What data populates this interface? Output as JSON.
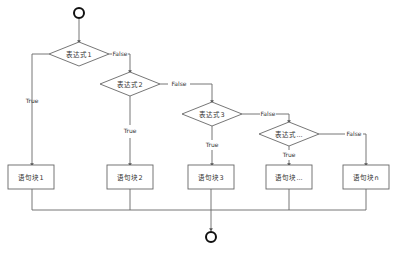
{
  "diagram": {
    "type": "flowchart",
    "colors": {
      "line": "#666666",
      "node_border": "#666666",
      "node_fill": "#ffffff",
      "terminal": "#111111",
      "text": "#333333"
    },
    "start": {
      "label": ""
    },
    "end": {
      "label": ""
    },
    "conditions": [
      {
        "id": "c1",
        "label": "表达式1"
      },
      {
        "id": "c2",
        "label": "表达式2"
      },
      {
        "id": "c3",
        "label": "表达式3"
      },
      {
        "id": "c4",
        "label": "表达式..."
      }
    ],
    "blocks": [
      {
        "id": "b1",
        "label": "语句块1"
      },
      {
        "id": "b2",
        "label": "语句块2"
      },
      {
        "id": "b3",
        "label": "语句块3"
      },
      {
        "id": "b4",
        "label": "语句块..."
      },
      {
        "id": "b5",
        "label": "语句块n"
      }
    ],
    "edge_labels": {
      "true": "True",
      "false": "False"
    },
    "edges": [
      {
        "from": "start",
        "to": "c1"
      },
      {
        "from": "c1",
        "to": "b1",
        "label": "True"
      },
      {
        "from": "c1",
        "to": "c2",
        "label": "False"
      },
      {
        "from": "c2",
        "to": "b2",
        "label": "True"
      },
      {
        "from": "c2",
        "to": "c3",
        "label": "False"
      },
      {
        "from": "c3",
        "to": "b3",
        "label": "True"
      },
      {
        "from": "c3",
        "to": "c4",
        "label": "False"
      },
      {
        "from": "c4",
        "to": "b4",
        "label": "True"
      },
      {
        "from": "c4",
        "to": "b5",
        "label": "False"
      },
      {
        "from": "b1",
        "to": "end"
      },
      {
        "from": "b2",
        "to": "end"
      },
      {
        "from": "b3",
        "to": "end"
      },
      {
        "from": "b4",
        "to": "end"
      },
      {
        "from": "b5",
        "to": "end"
      }
    ]
  }
}
